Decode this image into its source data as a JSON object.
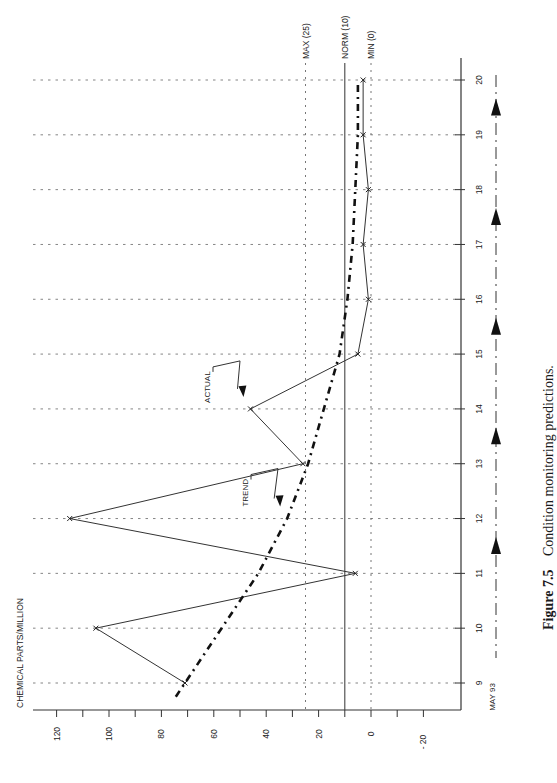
{
  "figure": {
    "number_label": "Figure 7.5",
    "caption": "Condition monitoring predictions."
  },
  "chart_data": {
    "type": "line",
    "orientation": "rotated-90 (x axis runs vertically, values increase leftward)",
    "title": "",
    "ylabel": "CHEMICAL PARTS/MILLION",
    "xlabel": "",
    "x_start_label": "MAY 93",
    "x": [
      9,
      10,
      11,
      12,
      13,
      14,
      15,
      16,
      17,
      18,
      19,
      20
    ],
    "y_ticks": [
      120,
      100,
      80,
      60,
      40,
      20,
      0,
      -20
    ],
    "ylim": [
      -25,
      125
    ],
    "grid": true,
    "series": [
      {
        "name": "ACTUAL",
        "style": "solid-with-markers",
        "values": [
          71,
          105,
          6,
          115,
          26,
          46,
          5,
          1,
          3,
          1,
          3,
          3
        ]
      },
      {
        "name": "TREND",
        "style": "dash-dot-bold",
        "values": [
          71,
          57,
          43,
          32,
          24,
          18,
          12,
          9,
          7,
          6,
          5,
          5
        ]
      }
    ],
    "reference_lines": [
      {
        "label": "MAX (25)",
        "value": 25,
        "style": "dotted"
      },
      {
        "label": "NORM (10)",
        "value": 10,
        "style": "solid"
      },
      {
        "label": "MIN (0)",
        "value": 0,
        "style": "dotted"
      }
    ],
    "annotations": [
      {
        "text": "ACTUAL",
        "points_to": {
          "x": 14,
          "series": "ACTUAL"
        }
      },
      {
        "text": "TREND",
        "points_to": {
          "x": 12,
          "series": "TREND"
        }
      }
    ],
    "timeline_arrows_between": [
      [
        11,
        12
      ],
      [
        13,
        14
      ],
      [
        15,
        16
      ],
      [
        17,
        18
      ],
      [
        19,
        20
      ]
    ]
  }
}
